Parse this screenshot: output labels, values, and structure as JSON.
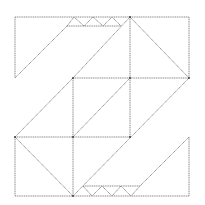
{
  "diagram": {
    "colors": {
      "stroke": "#8a8a8a",
      "vertex": "#333333",
      "background": "#ffffff"
    },
    "segments": [
      [
        15,
        17,
        130,
        17
      ],
      [
        130,
        17,
        189,
        17
      ],
      [
        189,
        17,
        189,
        78
      ],
      [
        15,
        17,
        15,
        78
      ],
      [
        15,
        78,
        67,
        26
      ],
      [
        67,
        26,
        121,
        26
      ],
      [
        130,
        17,
        189,
        78
      ],
      [
        130,
        17,
        130,
        137
      ],
      [
        130,
        17,
        73,
        78
      ],
      [
        73,
        78,
        15,
        137
      ],
      [
        73,
        78,
        189,
        78
      ],
      [
        73,
        78,
        73,
        196
      ],
      [
        73,
        137,
        130,
        78
      ],
      [
        15,
        137,
        130,
        137
      ],
      [
        189,
        78,
        73,
        196
      ],
      [
        15,
        137,
        15,
        196
      ],
      [
        15,
        196,
        189,
        196
      ],
      [
        15,
        137,
        73,
        196
      ],
      [
        189,
        137,
        189,
        196
      ],
      [
        189,
        137,
        140,
        186
      ],
      [
        83,
        186,
        140,
        186
      ]
    ],
    "zigzag_top": [
      [
        67,
        26
      ],
      [
        74,
        17
      ],
      [
        84,
        26
      ],
      [
        93,
        17
      ],
      [
        103,
        26
      ],
      [
        112,
        17
      ],
      [
        121,
        26
      ]
    ],
    "zigzag_bottom": [
      [
        83,
        186
      ],
      [
        92,
        196
      ],
      [
        102,
        186
      ],
      [
        112,
        196
      ],
      [
        121,
        186
      ],
      [
        131,
        196
      ],
      [
        140,
        186
      ]
    ],
    "vertices": [
      [
        130,
        17
      ],
      [
        73,
        78
      ],
      [
        130,
        78
      ],
      [
        15,
        137
      ],
      [
        73,
        137
      ],
      [
        130,
        137
      ],
      [
        73,
        196
      ],
      [
        189,
        78
      ]
    ]
  }
}
